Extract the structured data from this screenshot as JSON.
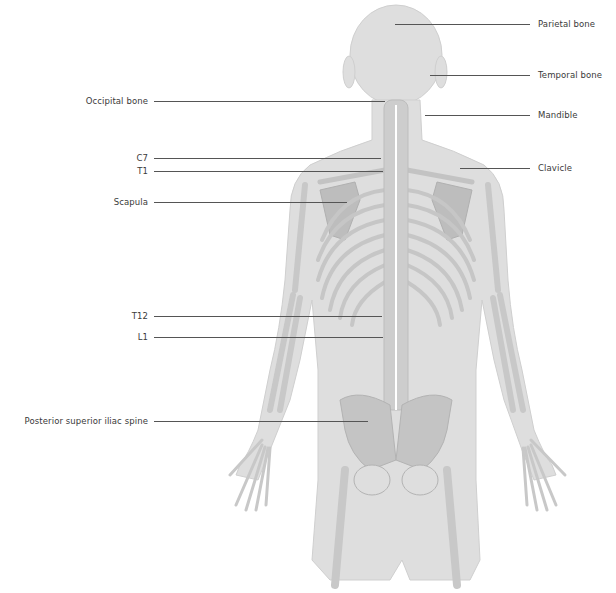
{
  "diagram": {
    "colors": {
      "body": "#dcdcdc",
      "bone": "#c9c9c9",
      "bone_dark": "#b5b5b5",
      "leader": "#555555",
      "text": "#3a3a3a",
      "spine_line": "#ffffff"
    },
    "labels_right": [
      {
        "id": "parietal-bone",
        "text": "Parietal bone",
        "y": 24,
        "line_x1": 395,
        "line_x2": 530
      },
      {
        "id": "temporal-bone",
        "text": "Temporal bone",
        "y": 75,
        "line_x1": 430,
        "line_x2": 530
      },
      {
        "id": "mandible",
        "text": "Mandible",
        "y": 115,
        "line_x1": 425,
        "line_x2": 530
      },
      {
        "id": "clavicle",
        "text": "Clavicle",
        "y": 168,
        "line_x1": 460,
        "line_x2": 530
      }
    ],
    "labels_left": [
      {
        "id": "occipital-bone",
        "text": "Occipital bone",
        "y": 101,
        "line_x1": 154,
        "line_x2": 385
      },
      {
        "id": "c7",
        "text": "C7",
        "y": 158,
        "line_x1": 154,
        "line_x2": 381
      },
      {
        "id": "t1",
        "text": "T1",
        "y": 171,
        "line_x1": 154,
        "line_x2": 383
      },
      {
        "id": "scapula",
        "text": "Scapula",
        "y": 202,
        "line_x1": 154,
        "line_x2": 347
      },
      {
        "id": "t12",
        "text": "T12",
        "y": 316,
        "line_x1": 154,
        "line_x2": 382
      },
      {
        "id": "l1",
        "text": "L1",
        "y": 337,
        "line_x1": 154,
        "line_x2": 383
      },
      {
        "id": "posterior-superior-iliac-spine",
        "text": "Posterior superior iliac spine",
        "y": 421,
        "line_x1": 154,
        "line_x2": 368
      }
    ]
  }
}
